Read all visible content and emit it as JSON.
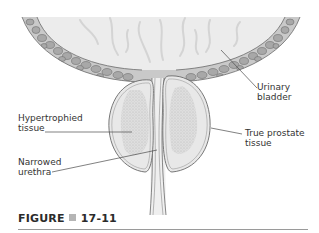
{
  "figure": {
    "labels": {
      "urinary_bladder": [
        "Urinary",
        "bladder"
      ],
      "hypertrophied_tissue": [
        "Hypertrophied",
        "tissue"
      ],
      "true_prostate_tissue": [
        "True prostate",
        "tissue"
      ],
      "narrowed_urethra": [
        "Narrowed",
        "urethra"
      ]
    },
    "colors": {
      "lumen": "#ececec",
      "wall_cells": "#a9a9a9",
      "wall_band": "#c8c8c8",
      "outline": "#6a6a6a",
      "prostate_fill": "#e6e6e6",
      "hypertrophy_stipple": "#c4c4c4",
      "leader_line": "#4a4a4a"
    }
  },
  "caption": {
    "prefix": "FIGURE",
    "number": "17-11"
  }
}
